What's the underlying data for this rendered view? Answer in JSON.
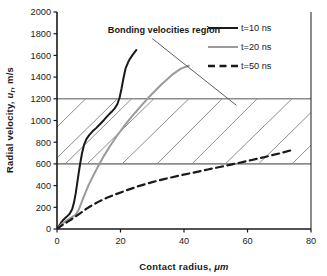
{
  "chart_data": {
    "type": "line",
    "title": "",
    "xlabel": "Contact radius, μm",
    "ylabel": "Radial velocity, u r , m/s",
    "ylabel_parts": {
      "prefix": "Radial velocity,  ",
      "italic": "u",
      "subscript": "r",
      "suffix": ", m/s"
    },
    "xlabel_parts": {
      "prefix": "Contact radius, ",
      "italic": "μm"
    },
    "xlim": [
      0,
      80
    ],
    "ylim": [
      0,
      2000
    ],
    "xticks": [
      0,
      20,
      40,
      60,
      80
    ],
    "yticks": [
      0,
      200,
      400,
      600,
      800,
      1000,
      1200,
      1400,
      1600,
      1800,
      2000
    ],
    "grid": false,
    "legend_position": "top-right",
    "annotations": [
      {
        "text": "Bonding velocities region",
        "x": 16,
        "y": 1810,
        "leader_from": [
          30,
          1755
        ],
        "leader_to": [
          56.5,
          1140
        ]
      }
    ],
    "shaded_band": {
      "label": "Bonding velocities region",
      "y_min": 600,
      "y_max": 1200,
      "x_min": 0,
      "x_max": 80,
      "hatch": "diagonal-up-right",
      "boundary_color": "#8c8c8c",
      "hatch_color": "#6e6e6e"
    },
    "series": [
      {
        "name": "t=10 ns",
        "style": "solid",
        "color": "#1a1a1a",
        "width": 2.0,
        "points": [
          [
            0,
            0
          ],
          [
            0.6,
            28
          ],
          [
            1.3,
            58
          ],
          [
            2.1,
            88
          ],
          [
            3.0,
            112
          ],
          [
            4.0,
            140
          ],
          [
            4.8,
            185
          ],
          [
            5.4,
            250
          ],
          [
            5.9,
            330
          ],
          [
            6.4,
            430
          ],
          [
            6.9,
            530
          ],
          [
            7.4,
            620
          ],
          [
            7.9,
            700
          ],
          [
            8.5,
            775
          ],
          [
            9.3,
            830
          ],
          [
            10.2,
            868
          ],
          [
            11.2,
            900
          ],
          [
            12.4,
            932
          ],
          [
            13.6,
            968
          ],
          [
            14.8,
            1005
          ],
          [
            16.0,
            1045
          ],
          [
            17.2,
            1080
          ],
          [
            18.2,
            1112
          ],
          [
            19.0,
            1150
          ],
          [
            19.7,
            1210
          ],
          [
            20.3,
            1290
          ],
          [
            20.9,
            1385
          ],
          [
            21.6,
            1480
          ],
          [
            22.6,
            1550
          ],
          [
            23.7,
            1600
          ],
          [
            25.0,
            1650
          ]
        ]
      },
      {
        "name": "t=20 ns",
        "style": "solid",
        "color": "#9a9a9a",
        "width": 2.0,
        "points": [
          [
            0,
            0
          ],
          [
            0.8,
            25
          ],
          [
            1.8,
            52
          ],
          [
            3.0,
            78
          ],
          [
            4.2,
            100
          ],
          [
            5.2,
            118
          ],
          [
            6.0,
            135
          ],
          [
            6.8,
            175
          ],
          [
            7.6,
            235
          ],
          [
            8.6,
            310
          ],
          [
            9.8,
            395
          ],
          [
            11.2,
            480
          ],
          [
            12.8,
            570
          ],
          [
            14.6,
            665
          ],
          [
            16.6,
            760
          ],
          [
            18.8,
            855
          ],
          [
            21.2,
            950
          ],
          [
            23.8,
            1045
          ],
          [
            26.6,
            1140
          ],
          [
            29.6,
            1235
          ],
          [
            32.8,
            1330
          ],
          [
            36.2,
            1420
          ],
          [
            39.0,
            1478
          ],
          [
            41.5,
            1505
          ]
        ]
      },
      {
        "name": "t=50 ns",
        "style": "dashed",
        "color": "#1a1a1a",
        "width": 2.2,
        "points": [
          [
            0,
            0
          ],
          [
            1.0,
            22
          ],
          [
            2.2,
            45
          ],
          [
            3.4,
            68
          ],
          [
            4.6,
            90
          ],
          [
            5.6,
            110
          ],
          [
            6.6,
            130
          ],
          [
            7.8,
            155
          ],
          [
            9.2,
            185
          ],
          [
            11.0,
            218
          ],
          [
            13.0,
            250
          ],
          [
            15.5,
            285
          ],
          [
            18.5,
            320
          ],
          [
            22.0,
            358
          ],
          [
            26.0,
            398
          ],
          [
            30.0,
            432
          ],
          [
            34.0,
            462
          ],
          [
            38.5,
            492
          ],
          [
            43.0,
            520
          ],
          [
            47.5,
            548
          ],
          [
            52.0,
            576
          ],
          [
            56.5,
            604
          ],
          [
            61.0,
            634
          ],
          [
            65.5,
            664
          ],
          [
            70.0,
            696
          ],
          [
            74.0,
            728
          ]
        ]
      }
    ],
    "hatch_lines": [
      {
        "x1": 0,
        "y1": 940,
        "x2": 9.0,
        "y2": 1200
      },
      {
        "x1": 0,
        "y1": 655,
        "x2": 19.0,
        "y2": 1200
      },
      {
        "x1": 2.6,
        "y1": 600,
        "x2": 23.5,
        "y2": 1200
      },
      {
        "x1": 9.5,
        "y1": 600,
        "x2": 30.5,
        "y2": 1200
      },
      {
        "x1": 20.5,
        "y1": 600,
        "x2": 41.5,
        "y2": 1200
      },
      {
        "x1": 31.5,
        "y1": 600,
        "x2": 52.0,
        "y2": 1200
      },
      {
        "x1": 42.5,
        "y1": 600,
        "x2": 63.0,
        "y2": 1200
      },
      {
        "x1": 53.0,
        "y1": 600,
        "x2": 74.0,
        "y2": 1200
      },
      {
        "x1": 63.5,
        "y1": 600,
        "x2": 80.0,
        "y2": 1073
      },
      {
        "x1": 74.0,
        "y1": 600,
        "x2": 80.0,
        "y2": 772
      }
    ]
  },
  "legend": {
    "items": [
      {
        "label": "t=10 ns",
        "style": "solid",
        "color": "#1a1a1a"
      },
      {
        "label": "t=20 ns",
        "style": "solid",
        "color": "#9a9a9a"
      },
      {
        "label": "t=50 ns",
        "style": "dashed",
        "color": "#1a1a1a"
      }
    ]
  },
  "colors": {
    "axis": "#1a1a1a",
    "band_line": "#8c8c8c",
    "hatch": "#6e6e6e",
    "series_1": "#1a1a1a",
    "series_2": "#9a9a9a",
    "series_3": "#1a1a1a",
    "background": "#ffffff"
  }
}
